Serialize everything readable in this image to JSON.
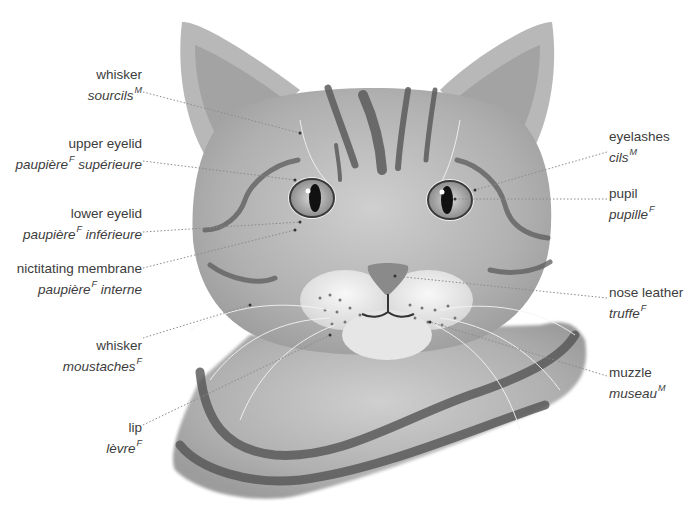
{
  "diagram": {
    "labels": [
      {
        "id": "whisker-eyebrow",
        "side": "left",
        "en": "whisker",
        "fr": "sourcils",
        "gender": "M",
        "x": 18,
        "y": 66,
        "w": 124,
        "line": [
          [
            143,
            92
          ],
          [
            300,
            133
          ]
        ]
      },
      {
        "id": "upper-eyelid",
        "side": "left",
        "en": "upper eyelid",
        "fr": "paupière",
        "fr_suffix": " supérieure",
        "gender": "F",
        "x": 10,
        "y": 135,
        "w": 132,
        "line": [
          [
            143,
            161
          ],
          [
            295,
            180
          ]
        ]
      },
      {
        "id": "lower-eyelid",
        "side": "left",
        "en": "lower eyelid",
        "fr": "paupière",
        "fr_suffix": " inférieure",
        "gender": "F",
        "x": 10,
        "y": 205,
        "w": 132,
        "line": [
          [
            143,
            232
          ],
          [
            300,
            222
          ]
        ]
      },
      {
        "id": "nictitating-membrane",
        "side": "left",
        "en": "nictitating membrane",
        "fr": "paupière",
        "fr_suffix": " interne",
        "gender": "F",
        "x": 0,
        "y": 260,
        "w": 142,
        "line": [
          [
            143,
            268
          ],
          [
            295,
            230
          ]
        ]
      },
      {
        "id": "whisker",
        "side": "left",
        "en": "whisker",
        "fr": "moustaches",
        "gender": "F",
        "x": 10,
        "y": 337,
        "w": 132,
        "line": [
          [
            143,
            338
          ],
          [
            250,
            305
          ]
        ]
      },
      {
        "id": "lip",
        "side": "left",
        "en": "lip",
        "fr": "lèvre",
        "gender": "F",
        "x": 60,
        "y": 419,
        "w": 82,
        "line": [
          [
            143,
            425
          ],
          [
            330,
            335
          ]
        ]
      },
      {
        "id": "eyelashes",
        "side": "right",
        "en": "eyelashes",
        "fr": "cils",
        "gender": "M",
        "x": 609,
        "y": 128,
        "w": 80,
        "line": [
          [
            607,
            152
          ],
          [
            475,
            190
          ]
        ]
      },
      {
        "id": "pupil",
        "side": "right",
        "en": "pupil",
        "fr": "pupille",
        "gender": "F",
        "x": 609,
        "y": 185,
        "w": 80,
        "line": [
          [
            607,
            199
          ],
          [
            455,
            199
          ]
        ]
      },
      {
        "id": "nose-leather",
        "side": "right",
        "en": "nose leather",
        "fr": "truffe",
        "gender": "F",
        "x": 609,
        "y": 284,
        "w": 90,
        "line": [
          [
            607,
            298
          ],
          [
            395,
            276
          ]
        ]
      },
      {
        "id": "muzzle",
        "side": "right",
        "en": "muzzle",
        "fr": "museau",
        "gender": "M",
        "x": 609,
        "y": 364,
        "w": 80,
        "line": [
          [
            607,
            376
          ],
          [
            430,
            322
          ]
        ]
      }
    ]
  },
  "colors": {
    "background": "#ffffff",
    "text": "#3c3c3c",
    "leader": "#8a8a8a",
    "fur": "#b4b4b4",
    "fur_light": "#d8d8d8",
    "stripe": "#5e5e5e",
    "muzzle": "#ececec",
    "eye_iris": "#bdbdbd",
    "pupil": "#111111",
    "nose": "#8d8d8d"
  }
}
